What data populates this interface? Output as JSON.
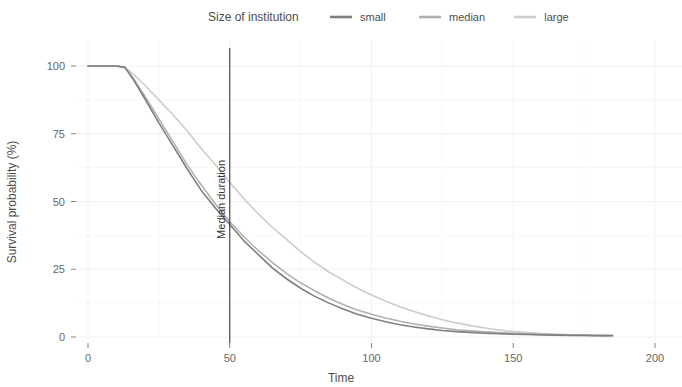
{
  "legend": {
    "title": "Size of institution",
    "entries": [
      {
        "label": "small",
        "color": "#7f7f7f"
      },
      {
        "label": "median",
        "color": "#b0b0b0"
      },
      {
        "label": "large",
        "color": "#cccccc"
      }
    ]
  },
  "axes": {
    "x": {
      "title": "Time",
      "ticks": [
        0,
        50,
        100,
        150,
        200
      ],
      "tick_labels": [
        "0",
        "50",
        "100",
        "150",
        "200"
      ],
      "range": [
        0,
        200
      ]
    },
    "y": {
      "title": "Survival probability (%)",
      "ticks": [
        0,
        25,
        50,
        75,
        100
      ],
      "tick_labels": [
        "0",
        "25",
        "50",
        "75",
        "100"
      ],
      "range": [
        0,
        100
      ]
    }
  },
  "annotation": {
    "label": "Median duration",
    "x_value": 50
  },
  "chart_data": {
    "type": "line",
    "title": "",
    "subtitle": "",
    "xlabel": "Time",
    "ylabel": "Survival probability (%)",
    "xlim": [
      0,
      200
    ],
    "ylim": [
      0,
      100
    ],
    "grid": true,
    "legend_position": "top",
    "legend_title": "Size of institution",
    "annotations": [
      {
        "type": "vline",
        "x": 50,
        "label": "Median duration",
        "color": "#3a3a3a"
      }
    ],
    "x": [
      0,
      5,
      10,
      13,
      16,
      20,
      25,
      30,
      35,
      40,
      45,
      50,
      55,
      60,
      65,
      70,
      75,
      80,
      85,
      90,
      95,
      100,
      105,
      110,
      115,
      120,
      125,
      130,
      135,
      140,
      145,
      150,
      155,
      160,
      165,
      170,
      175,
      180,
      185
    ],
    "series": [
      {
        "name": "small",
        "color": "#7f7f7f",
        "values": [
          100,
          100,
          100,
          99.5,
          95,
          88,
          79,
          70.5,
          62,
          54,
          47.5,
          41.5,
          35.5,
          30.5,
          25.5,
          21.5,
          18,
          15,
          12.5,
          10.3,
          8.4,
          6.9,
          5.6,
          4.5,
          3.7,
          3.0,
          2.4,
          2.0,
          1.7,
          1.4,
          1.2,
          1.0,
          0.9,
          0.8,
          0.7,
          0.6,
          0.6,
          0.5,
          0.5
        ]
      },
      {
        "name": "median",
        "color": "#b0b0b0",
        "values": [
          100,
          100,
          100,
          99.5,
          95.5,
          89,
          80.5,
          72,
          63.5,
          56,
          49,
          42.5,
          37,
          32,
          27.5,
          23.5,
          20,
          17,
          14.3,
          12,
          10,
          8.4,
          7.0,
          5.8,
          4.8,
          4.0,
          3.3,
          2.7,
          2.3,
          1.9,
          1.6,
          1.4,
          1.2,
          1.0,
          0.9,
          0.7,
          0.6,
          0.5,
          0.5
        ]
      },
      {
        "name": "large",
        "color": "#cccccc",
        "values": [
          100,
          100,
          100,
          99.5,
          97,
          93,
          87.5,
          82,
          76,
          69.5,
          63.5,
          57,
          51,
          45.5,
          40.5,
          36,
          31.5,
          27.5,
          24,
          21,
          18,
          15.5,
          13.2,
          11.2,
          9.4,
          7.8,
          6.4,
          5.2,
          4.2,
          3.3,
          2.6,
          2.0,
          1.6,
          1.3,
          1.0,
          0.8,
          0.7,
          0.6,
          0.5
        ]
      }
    ]
  }
}
